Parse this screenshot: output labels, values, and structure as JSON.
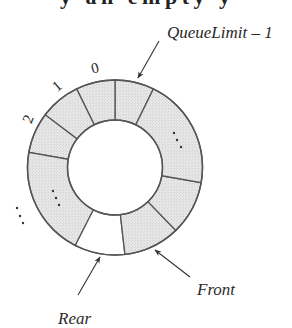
{
  "figure": {
    "cropped_header_text": "y an empty y",
    "ring": {
      "center": [
        115,
        167.5
      ],
      "outer_radius": 87.5,
      "inner_radius": 47.5,
      "fill_color": "#e4e4e4",
      "empty_color": "#ffffff",
      "stroke_color": "#555555",
      "segments": [
        {
          "id": "queuelimit-minus-1",
          "start": 64,
          "end": 90,
          "filled": true
        },
        {
          "id": "slot-0",
          "start": 90,
          "end": 116,
          "filled": true
        },
        {
          "id": "slot-1",
          "start": 116,
          "end": 143,
          "filled": true
        },
        {
          "id": "slot-2",
          "start": 143,
          "end": 170,
          "filled": true
        },
        {
          "id": "slots-left-ellipsis",
          "start": 170,
          "end": 243,
          "filled": true
        },
        {
          "id": "slot-rear",
          "start": 243,
          "end": 276.5,
          "filled": false
        },
        {
          "id": "slot-front",
          "start": 276.5,
          "end": 314,
          "filled": true
        },
        {
          "id": "slot-after-front",
          "start": 314,
          "end": 350,
          "filled": true
        },
        {
          "id": "slots-right-ellipsis",
          "start": 350,
          "end": 424,
          "filled": true
        }
      ]
    },
    "index_labels": [
      {
        "text": "0",
        "x": 95,
        "y": 73,
        "rotate": -14
      },
      {
        "text": "1",
        "x": 57,
        "y": 91,
        "rotate": -40
      },
      {
        "text": "2",
        "x": 28,
        "y": 124,
        "rotate": -68
      }
    ],
    "ellipses": [
      {
        "name": "outer-left-ellipsis",
        "dots": [
          [
            17,
            208
          ],
          [
            20,
            216
          ],
          [
            23,
            223
          ]
        ]
      },
      {
        "name": "inner-left-ellipsis",
        "dots": [
          [
            53,
            191
          ],
          [
            56,
            198
          ],
          [
            59,
            205
          ]
        ]
      },
      {
        "name": "inner-right-ellipsis",
        "dots": [
          [
            174,
            133
          ],
          [
            177,
            140
          ],
          [
            181,
            147
          ]
        ]
      }
    ],
    "pointers": [
      {
        "name": "queuelimit-pointer",
        "label": "QueueLimit – 1",
        "label_x": 167,
        "label_y": 38,
        "font_size": 17,
        "tail": [
          159,
          41
        ],
        "tip": [
          138,
          78
        ]
      },
      {
        "name": "rear-pointer",
        "label": "Rear",
        "label_x": 58,
        "label_y": 324,
        "font_size": 17,
        "tail": [
          78,
          295
        ],
        "tip": [
          100,
          257
        ]
      },
      {
        "name": "front-pointer",
        "label": "Front",
        "label_x": 197,
        "label_y": 295,
        "font_size": 17,
        "tail": [
          190,
          277
        ],
        "tip": [
          155,
          250
        ]
      }
    ]
  }
}
